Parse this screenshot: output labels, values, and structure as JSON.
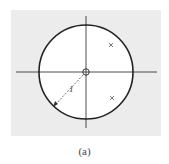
{
  "figure": {
    "type": "pole-zero plot",
    "caption": "(a)",
    "background_color": "#ececec",
    "plot_area_color": "#ffffff",
    "line_color": "#222222",
    "unit_circle": {
      "label": "1",
      "center": [
        86,
        72
      ],
      "radius": 47
    },
    "axes": {
      "horizontal": {
        "y": 72,
        "x1": 16,
        "x2": 157
      },
      "vertical": {
        "x": 86,
        "y1": 16,
        "y2": 128
      }
    },
    "zeros": [
      {
        "x": 86,
        "y": 72,
        "symbol": "o"
      }
    ],
    "poles": [
      {
        "x": 111,
        "y": 45,
        "symbol": "x"
      },
      {
        "x": 112,
        "y": 98,
        "symbol": "x"
      }
    ],
    "radius_label": "1"
  }
}
